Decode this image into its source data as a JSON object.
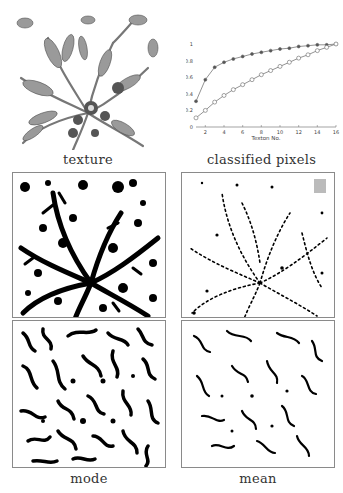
{
  "figure": {
    "panels": [
      {
        "id": "texture",
        "caption": "texture",
        "kind": "grayscale lace texture image"
      },
      {
        "id": "classified_pixels",
        "caption": "classified pixels",
        "kind": "line plot"
      },
      {
        "id": "mode_top",
        "caption": "",
        "kind": "binary segmentation image"
      },
      {
        "id": "mean_top",
        "caption": "",
        "kind": "binary segmentation image (sparse)"
      },
      {
        "id": "mode_bottom",
        "caption": "mode",
        "kind": "binary segmentation image"
      },
      {
        "id": "mean_bottom",
        "caption": "mean",
        "kind": "binary segmentation image"
      }
    ],
    "captions": {
      "texture": "texture",
      "classified_pixels": "classified pixels",
      "mode": "mode",
      "mean": "mean"
    }
  },
  "chart_data": {
    "type": "line",
    "title": "",
    "xlabel": "Texton No.",
    "ylabel": "Percentage",
    "xlim": [
      1,
      16
    ],
    "ylim": [
      0,
      1
    ],
    "xticks": [
      "2",
      "4",
      "6",
      "8",
      "10",
      "12",
      "14",
      "16"
    ],
    "yticks": [
      "0",
      "0.2",
      "0.4",
      "0.6",
      "0.8",
      "1"
    ],
    "grid": false,
    "legend": null,
    "x": [
      1,
      2,
      3,
      4,
      5,
      6,
      7,
      8,
      9,
      10,
      11,
      12,
      13,
      14,
      15,
      16
    ],
    "series": [
      {
        "name": "filled markers",
        "marker": "filled-circle",
        "values": [
          0.31,
          0.57,
          0.72,
          0.78,
          0.82,
          0.85,
          0.88,
          0.9,
          0.92,
          0.94,
          0.95,
          0.97,
          0.98,
          0.99,
          0.99,
          1.0
        ]
      },
      {
        "name": "open markers",
        "marker": "open-circle",
        "values": [
          0.11,
          0.2,
          0.3,
          0.38,
          0.45,
          0.51,
          0.57,
          0.63,
          0.68,
          0.73,
          0.78,
          0.83,
          0.87,
          0.92,
          0.96,
          1.0
        ]
      }
    ]
  }
}
